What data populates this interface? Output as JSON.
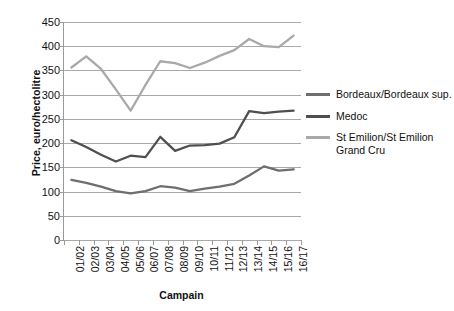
{
  "chart_data": {
    "type": "line",
    "title": "",
    "xlabel": "Campain",
    "ylabel": "Price, euro/hectolitre",
    "categories": [
      "01/02",
      "02/03",
      "03/04",
      "04/05",
      "05/06",
      "06/07",
      "07/08",
      "08/09",
      "09/10",
      "10/11",
      "11/12",
      "12/13",
      "13/14",
      "14/15",
      "15/16",
      "16/17"
    ],
    "ylim": [
      0,
      450
    ],
    "yticks": [
      0,
      50,
      100,
      150,
      200,
      250,
      300,
      350,
      400,
      450
    ],
    "grid": true,
    "legend_position": "right",
    "series": [
      {
        "name": "Bordeaux/Bordeaux sup.",
        "color": "#6e6e6e",
        "values": [
          124,
          118,
          110,
          101,
          96,
          101,
          111,
          108,
          101,
          106,
          110,
          116,
          133,
          152,
          143,
          146
        ]
      },
      {
        "name": "Medoc",
        "color": "#4f4f4f",
        "values": [
          206,
          192,
          176,
          162,
          174,
          171,
          213,
          184,
          195,
          196,
          199,
          212,
          266,
          262,
          265,
          267
        ]
      },
      {
        "name": "St Emilion/St Emilion Grand Cru",
        "color": "#a9a9a9",
        "values": [
          356,
          379,
          353,
          311,
          267,
          320,
          369,
          365,
          355,
          366,
          380,
          392,
          415,
          400,
          398,
          422
        ]
      }
    ]
  },
  "legend": {
    "items": [
      {
        "label": "Bordeaux/Bordeaux sup.",
        "color": "#6e6e6e"
      },
      {
        "label": "Medoc",
        "color": "#4f4f4f"
      },
      {
        "label": "St Emilion/St Emilion Grand Cru",
        "color": "#a9a9a9"
      }
    ]
  }
}
